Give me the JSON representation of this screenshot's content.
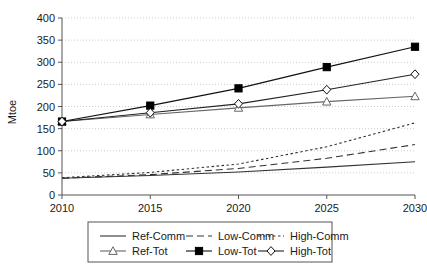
{
  "chart_data": {
    "type": "line",
    "title": "",
    "xlabel": "",
    "ylabel": "Mtoe",
    "x": [
      2010,
      2015,
      2020,
      2025,
      2030
    ],
    "xtick_labels": [
      "2010",
      "2015",
      "2020",
      "2025",
      "2030"
    ],
    "ytick_labels": [
      "0",
      "50",
      "100",
      "150",
      "200",
      "250",
      "300",
      "350",
      "400"
    ],
    "yticks": [
      0,
      50,
      100,
      150,
      200,
      250,
      300,
      350,
      400
    ],
    "xlim": [
      2010,
      2030
    ],
    "ylim": [
      0,
      400
    ],
    "grid": "horizontal-dotted",
    "legend_position": "below-plot",
    "series": [
      {
        "name": "Ref-Comm",
        "style": "solid",
        "marker": "none",
        "color": "#333333",
        "values": [
          38,
          44,
          52,
          63,
          75
        ]
      },
      {
        "name": "Low-Comm",
        "style": "dashed",
        "marker": "none",
        "color": "#333333",
        "values": [
          38,
          46,
          60,
          83,
          114
        ]
      },
      {
        "name": "High-Comm",
        "style": "dotted",
        "marker": "none",
        "color": "#333333",
        "values": [
          39,
          51,
          70,
          109,
          163
        ]
      },
      {
        "name": "Ref-Tot",
        "style": "solid",
        "marker": "triangle-open",
        "color": "#666666",
        "values": [
          166,
          182,
          197,
          211,
          223
        ]
      },
      {
        "name": "Low-Tot",
        "style": "solid",
        "marker": "square-filled",
        "color": "#111111",
        "values": [
          166,
          202,
          241,
          289,
          335
        ]
      },
      {
        "name": "High-Tot",
        "style": "solid",
        "marker": "diamond-open",
        "color": "#222222",
        "values": [
          166,
          186,
          206,
          238,
          273
        ]
      }
    ]
  },
  "legend": {
    "items": [
      {
        "label": "Ref-Comm",
        "icon": "line-solid-icon"
      },
      {
        "label": "Low-Comm",
        "icon": "line-dashed-icon"
      },
      {
        "label": "High-Comm",
        "icon": "line-dotted-icon"
      },
      {
        "label": "Ref-Tot",
        "icon": "line-triangle-marker-icon"
      },
      {
        "label": "Low-Tot",
        "icon": "line-square-marker-icon"
      },
      {
        "label": "High-Tot",
        "icon": "line-diamond-marker-icon"
      }
    ]
  },
  "colors": {
    "axis": "#555555",
    "grid": "#cccccc",
    "text": "#1a1a1a",
    "legend_border": "#555555",
    "background": "#ffffff"
  }
}
